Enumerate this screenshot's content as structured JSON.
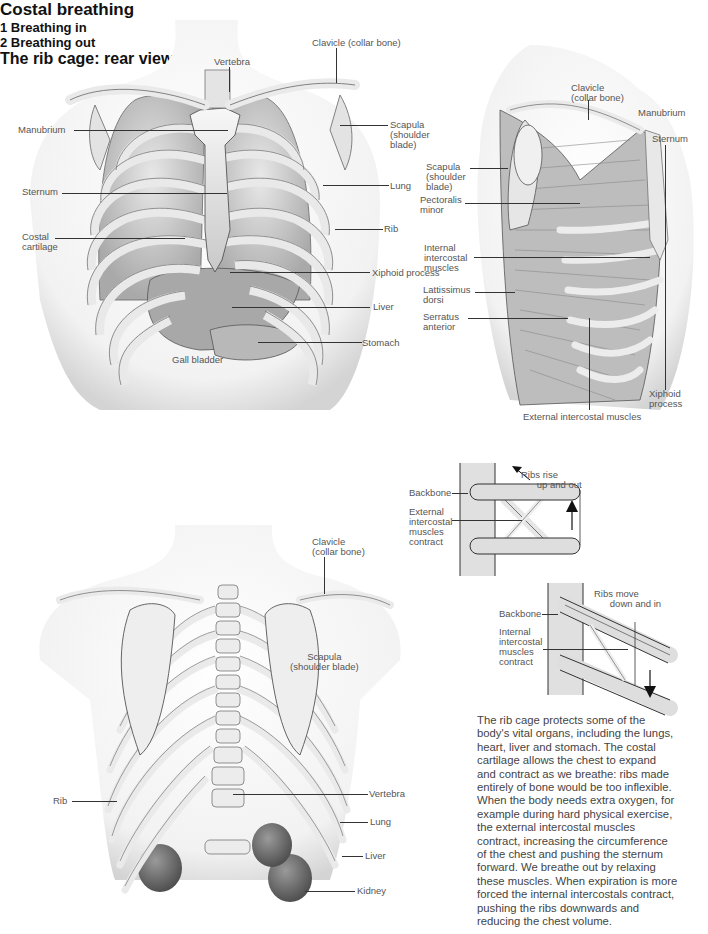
{
  "figures": {
    "front": {
      "labels": {
        "vertebra": "Vertebra",
        "clavicle": "Clavicle (collar bone)",
        "manubrium": "Manubrium",
        "scapula": "Scapula\n(shoulder\nblade)",
        "sternum": "Sternum",
        "lung": "Lung",
        "costal_cartilage": "Costal\ncartilage",
        "rib": "Rib",
        "xiphoid": "Xiphoid process",
        "liver": "Liver",
        "stomach": "Stomach",
        "gall_bladder": "Gall bladder"
      }
    },
    "costal": {
      "title": "Costal breathing",
      "labels": {
        "clavicle": "Clavicle\n(collar bone)",
        "manubrium": "Manubrium",
        "sternum": "Sternum",
        "scapula": "Scapula\n(shoulder\nblade)",
        "pectoralis": "Pectoralis\nminor",
        "internal_intercostal": "Internal\nintercostal\nmuscles",
        "lattissimus": "Lattissimus\ndorsi",
        "serratus": "Serratus\nanterior",
        "xiphoid": "Xiphoid\nprocess",
        "external_intercostal": "External intercostal muscles"
      }
    },
    "breathing_in": {
      "title": "1 Breathing in",
      "labels": {
        "ribs": "Ribs rise\n      up and out",
        "backbone": "Backbone",
        "muscles": "External\nintercostal\nmuscles\ncontract"
      }
    },
    "breathing_out": {
      "title": "2 Breathing out",
      "labels": {
        "ribs": "Ribs move\n      down and in",
        "backbone": "Backbone",
        "muscles": "Internal\nintercostal\nmuscles\ncontract"
      }
    },
    "rear": {
      "title": "The rib cage: rear view",
      "labels": {
        "clavicle": "Clavicle\n(collar bone)",
        "scapula": "Scapula\n(shoulder blade)",
        "rib": "Rib",
        "vertebra": "Vertebra",
        "lung": "Lung",
        "liver": "Liver",
        "kidney": "Kidney"
      }
    }
  },
  "body_text": {
    "lines": [
      "The rib cage protects some of the",
      "body's vital organs, including the lungs,",
      "heart, liver and stomach. The costal",
      "cartilage allows the chest to expand",
      "and contract as we breathe: ribs made",
      "entirely of bone would be too inflexible.",
      "When the body needs extra oxygen, for",
      "example during hard physical exercise,",
      "the external intercostal muscles",
      "contract, increasing the circumference",
      "of the chest and pushing the sternum",
      "forward. We breathe out by relaxing",
      "these muscles. When expiration is more",
      "forced the internal intercostals contract,",
      "pushing the ribs downwards and",
      "reducing the chest volume."
    ]
  },
  "colors": {
    "bone": "#ededed",
    "bone_shade": "#bcbcbc",
    "outline": "#555555",
    "kidney": "#6a6a6a",
    "backbone_fill": "#dcdcdc"
  }
}
